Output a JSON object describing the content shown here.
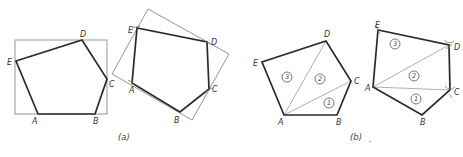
{
  "figure": {
    "panels": [
      {
        "id": "a",
        "caption": "(a)",
        "description": "Pentagon copied by enclosing rectangle method",
        "left_pentagon": {
          "vertices": {
            "A": "A",
            "B": "B",
            "C": "C",
            "D": "D",
            "E": "E"
          }
        },
        "right_pentagon": {
          "vertices": {
            "A": "A",
            "B": "B",
            "C": "C",
            "D": "D",
            "E": "E"
          }
        }
      },
      {
        "id": "b",
        "caption": "(b)",
        "description": "Pentagon copied by triangulation method",
        "left_pentagon": {
          "vertices": {
            "A": "A",
            "B": "B",
            "C": "C",
            "D": "D",
            "E": "E"
          },
          "triangles": [
            "1",
            "2",
            "3"
          ]
        },
        "right_pentagon": {
          "vertices": {
            "A": "A",
            "B": "B",
            "C": "C",
            "D": "D",
            "E": "E"
          },
          "triangles": [
            "1",
            "2",
            "3"
          ]
        }
      }
    ],
    "trailing_mark": "."
  },
  "colors": {
    "outline": "#2a2a2a",
    "construction": "#8a8a8a"
  }
}
